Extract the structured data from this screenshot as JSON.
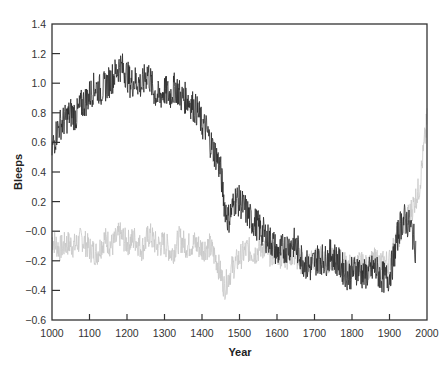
{
  "chart_data": {
    "type": "line",
    "title": "",
    "xlabel": "Year",
    "ylabel": "Bleeps",
    "xlim": [
      1000,
      2000
    ],
    "ylim": [
      -0.6,
      1.4
    ],
    "xticks": [
      1000,
      1100,
      1200,
      1300,
      1400,
      1500,
      1600,
      1700,
      1800,
      1900,
      2000
    ],
    "yticks": [
      1.4,
      1.2,
      1.0,
      0.8,
      0.6,
      0.4,
      0.2,
      0.0,
      -0.2,
      -0.4,
      -0.6
    ],
    "ytick_labels": [
      "1.4",
      "1.2",
      "1.0",
      "0.8",
      "0.6",
      "0.4",
      "0.2",
      "−0.0",
      "−0.2",
      "−0.4",
      "−0.6"
    ],
    "grid": false,
    "legend": null,
    "series": [
      {
        "name": "light series",
        "color": "#c8c8c8",
        "x": [
          1000,
          1020,
          1040,
          1060,
          1080,
          1100,
          1120,
          1140,
          1160,
          1180,
          1200,
          1220,
          1240,
          1260,
          1280,
          1300,
          1320,
          1340,
          1360,
          1380,
          1400,
          1420,
          1440,
          1460,
          1480,
          1500,
          1520,
          1540,
          1560,
          1580,
          1600,
          1620,
          1640,
          1660,
          1680,
          1700,
          1720,
          1740,
          1760,
          1780,
          1800,
          1820,
          1840,
          1860,
          1880,
          1900,
          1920,
          1940,
          1960,
          1980,
          2000
        ],
        "values": [
          -0.05,
          -0.12,
          -0.08,
          -0.1,
          -0.05,
          -0.12,
          -0.15,
          -0.05,
          -0.1,
          -0.02,
          -0.08,
          -0.05,
          -0.12,
          -0.02,
          -0.1,
          -0.08,
          -0.15,
          -0.05,
          -0.1,
          -0.08,
          -0.12,
          -0.1,
          -0.2,
          -0.38,
          -0.25,
          -0.18,
          -0.12,
          -0.15,
          -0.1,
          -0.15,
          -0.15,
          -0.18,
          -0.15,
          -0.2,
          -0.22,
          -0.2,
          -0.18,
          -0.2,
          -0.2,
          -0.22,
          -0.25,
          -0.22,
          -0.25,
          -0.2,
          -0.22,
          -0.2,
          -0.05,
          0.05,
          0.15,
          0.3,
          0.75
        ],
        "amplitude": 0.09
      },
      {
        "name": "dark series",
        "color": "#2a2a2a",
        "x": [
          1000,
          1010,
          1020,
          1035,
          1050,
          1065,
          1080,
          1090,
          1100,
          1115,
          1130,
          1150,
          1165,
          1180,
          1195,
          1210,
          1225,
          1240,
          1255,
          1270,
          1285,
          1300,
          1315,
          1330,
          1345,
          1360,
          1375,
          1390,
          1400,
          1410,
          1420,
          1430,
          1440,
          1450,
          1460,
          1470,
          1480,
          1490,
          1500,
          1515,
          1530,
          1545,
          1560,
          1575,
          1590,
          1600,
          1615,
          1630,
          1645,
          1660,
          1675,
          1690,
          1700,
          1715,
          1730,
          1745,
          1760,
          1775,
          1790,
          1800,
          1815,
          1830,
          1845,
          1860,
          1875,
          1890,
          1900,
          1910,
          1920,
          1930,
          1940,
          1950,
          1960,
          1970
        ],
        "values": [
          0.55,
          0.65,
          0.72,
          0.75,
          0.8,
          0.78,
          0.86,
          0.88,
          0.92,
          0.98,
          0.95,
          1.0,
          1.05,
          1.12,
          1.08,
          1.0,
          1.02,
          0.98,
          1.08,
          0.95,
          0.9,
          0.95,
          0.92,
          0.98,
          0.9,
          0.9,
          0.85,
          0.8,
          0.72,
          0.7,
          0.62,
          0.55,
          0.5,
          0.4,
          0.18,
          0.08,
          0.15,
          0.22,
          0.2,
          0.15,
          0.08,
          0.05,
          0.0,
          -0.05,
          -0.08,
          -0.15,
          -0.12,
          -0.1,
          -0.08,
          -0.15,
          -0.22,
          -0.25,
          -0.2,
          -0.18,
          -0.2,
          -0.15,
          -0.2,
          -0.25,
          -0.3,
          -0.28,
          -0.25,
          -0.3,
          -0.28,
          -0.25,
          -0.3,
          -0.32,
          -0.3,
          -0.2,
          -0.05,
          0.05,
          0.08,
          0.05,
          0.0,
          -0.12
        ],
        "amplitude": 0.11
      }
    ]
  }
}
